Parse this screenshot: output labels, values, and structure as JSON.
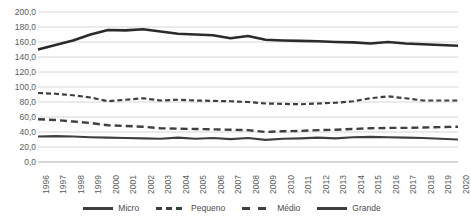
{
  "chart_data": {
    "type": "line",
    "title": "",
    "xlabel": "",
    "ylabel": "",
    "ylim": [
      0,
      200
    ],
    "ytick_step": 20,
    "grid": true,
    "legend_position": "bottom",
    "number_format": "comma-decimal-one",
    "categories": [
      "1996",
      "1997",
      "1998",
      "1999",
      "2000",
      "2001",
      "2002",
      "2003",
      "2004",
      "2005",
      "2006",
      "2007",
      "2008",
      "2009",
      "2010",
      "2011",
      "2012",
      "2013",
      "2014",
      "2015",
      "2016",
      "2017",
      "2018",
      "2019",
      "2020"
    ],
    "ytick_labels": [
      "0,0",
      "20,0",
      "40,0",
      "60,0",
      "80,0",
      "100,0",
      "120,0",
      "140,0",
      "160,0",
      "180,0",
      "200,0"
    ],
    "series": [
      {
        "name": "Micro",
        "style": "solid",
        "color": "#3f3f3f",
        "values": [
          34.0,
          34.5,
          34.0,
          33.0,
          32.5,
          32.0,
          31.5,
          31.0,
          32.5,
          31.0,
          32.0,
          30.5,
          32.0,
          29.5,
          31.0,
          31.5,
          32.5,
          31.5,
          33.0,
          33.5,
          33.0,
          32.5,
          32.0,
          31.0,
          30.0
        ]
      },
      {
        "name": "Pequeno",
        "style": "dashed-short",
        "color": "#3f3f3f",
        "values": [
          92.0,
          91.0,
          89.0,
          86.0,
          81.0,
          83.0,
          85.0,
          82.0,
          83.0,
          82.0,
          81.5,
          81.0,
          80.0,
          78.0,
          77.5,
          77.0,
          78.0,
          79.0,
          81.0,
          85.0,
          87.5,
          85.0,
          82.0,
          82.0,
          82.0
        ]
      },
      {
        "name": "Médio",
        "style": "dashed-long",
        "color": "#3f3f3f",
        "values": [
          57.0,
          56.0,
          54.0,
          52.0,
          49.0,
          48.0,
          47.0,
          45.0,
          44.5,
          44.0,
          43.5,
          43.0,
          42.5,
          40.0,
          41.0,
          41.5,
          42.5,
          43.0,
          44.0,
          45.0,
          45.5,
          45.5,
          46.0,
          46.5,
          47.0
        ]
      },
      {
        "name": "Grande",
        "style": "solid-thick",
        "color": "#2b2b2b",
        "values": [
          150.0,
          156.0,
          162.0,
          170.0,
          176.0,
          175.5,
          177.0,
          174.0,
          171.0,
          170.0,
          169.0,
          165.0,
          168.0,
          163.0,
          162.0,
          161.5,
          161.0,
          160.0,
          159.5,
          158.0,
          160.0,
          158.0,
          157.0,
          156.0,
          155.0
        ]
      }
    ]
  }
}
